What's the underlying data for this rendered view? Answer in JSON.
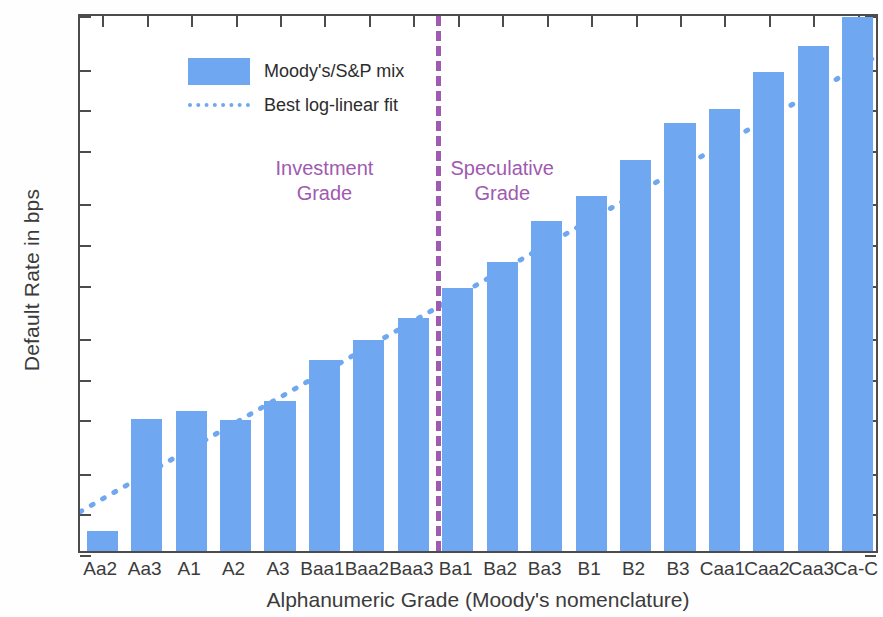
{
  "chart_data": {
    "type": "bar",
    "title": "",
    "xlabel": "Alphanumeric Grade (Moody's nomenclature)",
    "ylabel": "Default Rate in bps",
    "yscale": "log",
    "ylim": [
      0.5,
      5000
    ],
    "ytick_labels": [
      "5000",
      "2000",
      "1000",
      "500",
      "200",
      "100",
      "50",
      "20",
      "10",
      "5",
      "2",
      "1",
      "0.5"
    ],
    "ytick_values": [
      5000,
      2000,
      1000,
      500,
      200,
      100,
      50,
      20,
      10,
      5,
      2,
      1,
      0.5
    ],
    "grid": false,
    "legend_position": "upper-left",
    "categories": [
      "Aa2",
      "Aa3",
      "A1",
      "A2",
      "A3",
      "Baa1",
      "Baa2",
      "Baa3",
      "Ba1",
      "Ba2",
      "Ba3",
      "B1",
      "B2",
      "B3",
      "Caa1",
      "Caa2",
      "Caa3",
      "Ca-C"
    ],
    "series": [
      {
        "name": "Moody's/S&P mix",
        "type": "bar",
        "color": "#6fa8f0",
        "values": [
          0.7,
          4.8,
          5.5,
          4.7,
          6.5,
          13,
          18.5,
          27,
          45,
          70,
          140,
          215,
          400,
          750,
          950,
          1800,
          2800,
          4600
        ]
      },
      {
        "name": "Best log-linear fit",
        "type": "line",
        "style": "dotted",
        "color": "#6fa8f0",
        "values": [
          1.3,
          2.0,
          3.1,
          4.8,
          7.4,
          11.4,
          17.6,
          27.2,
          42.0,
          64.8,
          100.0,
          154.4,
          238.3,
          367.9,
          567.9,
          876.6,
          1353.2,
          2088.9
        ]
      }
    ],
    "annotations": [
      {
        "text": "Investment\nGrade",
        "color": "#a05ab0",
        "category_anchor": "Baa1"
      },
      {
        "text": "Speculative\nGrade",
        "color": "#a05ab0",
        "category_anchor": "Ba2"
      }
    ],
    "divider": {
      "label": "investment-speculative-divider",
      "color": "#a05ab0",
      "style": "dashed",
      "between": [
        "Baa3",
        "Ba1"
      ]
    }
  },
  "legend": {
    "items": [
      {
        "label": "Moody's/S&P mix",
        "marker": "swatch"
      },
      {
        "label": "Best log-linear fit",
        "marker": "dotted-line"
      }
    ]
  }
}
